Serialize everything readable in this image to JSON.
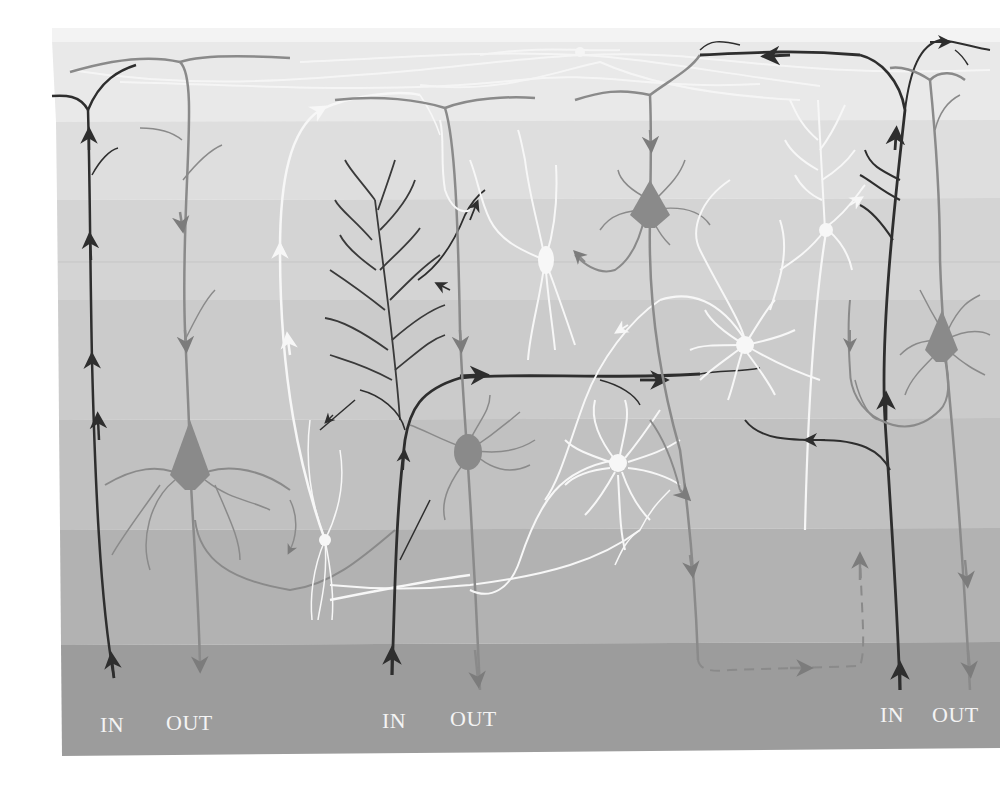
{
  "figure": {
    "type": "cortical-layer-neuron-circuit-illustration",
    "layers": [
      {
        "index": 1,
        "y_top": 28,
        "y_bottom": 120,
        "color": "#e9e9e9"
      },
      {
        "index": 2,
        "y_top": 120,
        "y_bottom": 200,
        "color": "#dedede"
      },
      {
        "index": 3,
        "y_top": 200,
        "y_bottom": 300,
        "color": "#d4d4d4"
      },
      {
        "index": 4,
        "y_top": 300,
        "y_bottom": 420,
        "color": "#cbcbcb"
      },
      {
        "index": 5,
        "y_top": 420,
        "y_bottom": 530,
        "color": "#c1c1c1"
      },
      {
        "index": 6,
        "y_top": 530,
        "y_bottom": 645,
        "color": "#b2b2b2"
      },
      {
        "index": 7,
        "y_top": 645,
        "y_bottom": 755,
        "color": "#9c9c9c"
      }
    ],
    "colors": {
      "input_fiber": "#2e2e2e",
      "pyramidal_output": "#8a8a8a",
      "interneuron": "#f7f7f7",
      "label_text": "#f4f4f4"
    },
    "columns": [
      {
        "name": "left-column",
        "in_label": "IN",
        "out_label": "OUT"
      },
      {
        "name": "middle-column",
        "in_label": "IN",
        "out_label": "OUT"
      },
      {
        "name": "right-column",
        "in_label": "IN",
        "out_label": "OUT"
      }
    ]
  },
  "margin_fragments": [
    "s",
    "e",
    "."
  ]
}
